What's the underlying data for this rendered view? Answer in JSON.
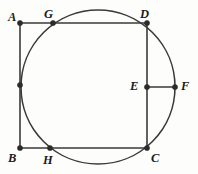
{
  "figure": {
    "width": 198,
    "height": 174,
    "background_color": "#fdfdfc",
    "stroke_color": "#3a3a3a",
    "label_color": "#1b1b1b",
    "point_color": "#2b2b2b",
    "line_width": 1.6,
    "point_radius": 2.6
  },
  "circle": {
    "name": "main-circle",
    "center_x": 98,
    "center_y": 87,
    "radius": 77
  },
  "square": {
    "name": "square-abcd",
    "left": 20,
    "top": 23,
    "right": 147,
    "bottom": 148,
    "width": 127,
    "height": 125,
    "sides": [
      {
        "name": "side-ad",
        "from": "A",
        "to": "D"
      },
      {
        "name": "side-dc",
        "from": "D",
        "to": "C"
      },
      {
        "name": "side-cb",
        "from": "C",
        "to": "B"
      },
      {
        "name": "side-ba",
        "from": "B",
        "to": "A"
      }
    ]
  },
  "segments": [
    {
      "name": "segment-ef",
      "from": "E",
      "to": "F",
      "x1": 147,
      "y1": 87,
      "x2": 175,
      "y2": 87
    }
  ],
  "points": [
    {
      "id": "A",
      "label": "A",
      "x": 20,
      "y": 23,
      "label_x": 8,
      "label_y": 11,
      "labeled": true,
      "on": "square-corner-top-left"
    },
    {
      "id": "G",
      "label": "G",
      "x": 53,
      "y": 23,
      "label_x": 44,
      "label_y": 8,
      "labeled": true,
      "on": "circle-and-side-ad"
    },
    {
      "id": "D",
      "label": "D",
      "x": 147,
      "y": 23,
      "label_x": 140,
      "label_y": 8,
      "labeled": true,
      "on": "square-corner-top-right-on-circle"
    },
    {
      "id": "E",
      "label": "E",
      "x": 147,
      "y": 87,
      "label_x": 130,
      "label_y": 80,
      "labeled": true,
      "on": "side-dc-midpoint"
    },
    {
      "id": "F",
      "label": "F",
      "x": 175,
      "y": 87,
      "label_x": 181,
      "label_y": 80,
      "labeled": true,
      "on": "circle-rightmost"
    },
    {
      "id": "B",
      "label": "B",
      "x": 20,
      "y": 148,
      "label_x": 8,
      "label_y": 152,
      "labeled": true,
      "on": "square-corner-bottom-left"
    },
    {
      "id": "H",
      "label": "H",
      "x": 50,
      "y": 148,
      "label_x": 43,
      "label_y": 154,
      "labeled": true,
      "on": "circle-and-side-bc"
    },
    {
      "id": "C",
      "label": "C",
      "x": 147,
      "y": 148,
      "label_x": 151,
      "label_y": 152,
      "labeled": true,
      "on": "square-corner-bottom-right-on-circle"
    },
    {
      "id": "P1",
      "label": "",
      "x": 20,
      "y": 85,
      "label_x": 0,
      "label_y": 0,
      "labeled": false,
      "on": "circle-and-side-ab"
    }
  ]
}
